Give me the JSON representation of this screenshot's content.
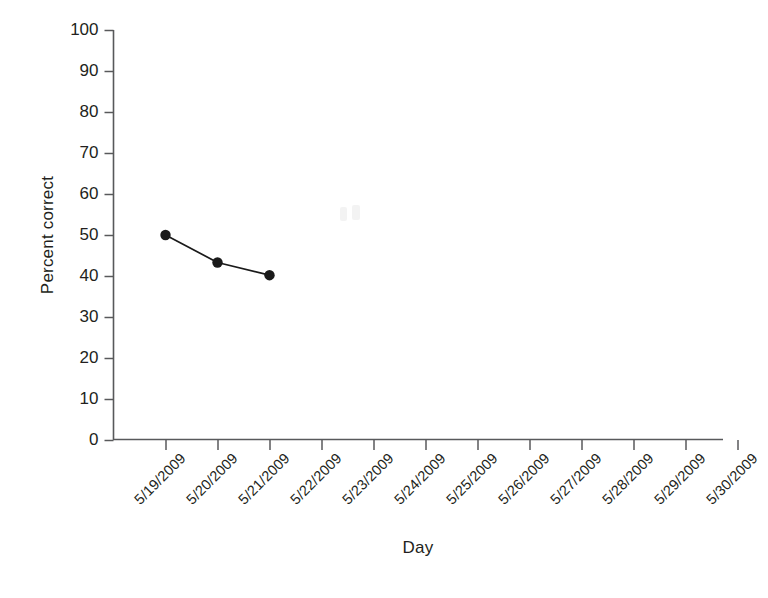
{
  "chart_data": {
    "type": "line",
    "title": "",
    "xlabel": "Day",
    "ylabel": "Percent correct",
    "categories": [
      "5/19/2009",
      "5/20/2009",
      "5/21/2009",
      "5/22/2009",
      "5/23/2009",
      "5/24/2009",
      "5/25/2009",
      "5/26/2009",
      "5/27/2009",
      "5/28/2009",
      "5/29/2009",
      "5/30/2009"
    ],
    "values": [
      50,
      43.3,
      40.2,
      null,
      null,
      null,
      null,
      null,
      null,
      null,
      null,
      null
    ],
    "ylim": [
      0,
      100
    ],
    "ytick_labels": [
      "0",
      "10",
      "20",
      "30",
      "40",
      "50",
      "60",
      "70",
      "80",
      "90",
      "100"
    ],
    "ytick_values": [
      0,
      10,
      20,
      30,
      40,
      50,
      60,
      70,
      80,
      90,
      100
    ],
    "grid": false,
    "legend": false,
    "marker": "filled-circle",
    "series_color": "#1a1a1a"
  },
  "axis": {
    "x_title": "Day",
    "y_title": "Percent correct",
    "line_color": "#58595b"
  }
}
